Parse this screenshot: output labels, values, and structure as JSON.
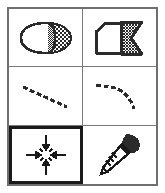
{
  "palette": {
    "title": "Tool Palette",
    "columns": 2,
    "rows": 3,
    "selected_index": 4,
    "colors": {
      "frame_border": "#6f6f6f",
      "grid_line": "#7a7a7a",
      "cell_background": "#ffffff",
      "icon_stroke": "#1a1a1a",
      "selection_border": "#1a1a1a",
      "dither_fill": "#2b2b2b"
    },
    "items": [
      {
        "index": 0,
        "icon": "dithered-circle-fill-icon",
        "label": "Gradient Fill Shape",
        "selected": false,
        "row": 0,
        "col": 0
      },
      {
        "index": 1,
        "icon": "dithered-polygon-fill-icon",
        "label": "Pattern Fill Polygon",
        "selected": false,
        "row": 0,
        "col": 1
      },
      {
        "index": 2,
        "icon": "dashed-straight-line-icon",
        "label": "Straight Line",
        "selected": false,
        "row": 1,
        "col": 0
      },
      {
        "index": 3,
        "icon": "dashed-curve-line-icon",
        "label": "Curved Line",
        "selected": false,
        "row": 1,
        "col": 1
      },
      {
        "index": 4,
        "icon": "converge-arrows-icon",
        "label": "Converge",
        "selected": true,
        "row": 2,
        "col": 0
      },
      {
        "index": 5,
        "icon": "eyedropper-icon",
        "label": "Eyedropper",
        "selected": false,
        "row": 2,
        "col": 1
      }
    ]
  }
}
